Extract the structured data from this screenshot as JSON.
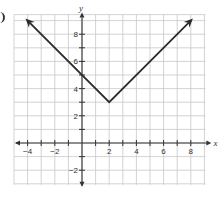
{
  "chart_data": {
    "type": "line",
    "title": "",
    "equation": "y = |x - 2| + 3",
    "xlabel": "x",
    "ylabel": "y",
    "xlim": [
      -5,
      9
    ],
    "ylim": [
      -3,
      9
    ],
    "grid": true,
    "x_ticks": [
      -4,
      -2,
      2,
      4,
      6,
      8
    ],
    "y_ticks": [
      -2,
      2,
      4,
      6,
      8
    ],
    "x_tick_labels": [
      "−4",
      "−2",
      "2",
      "4",
      "6",
      "8"
    ],
    "y_tick_labels": [
      "−2",
      "2",
      "4",
      "6",
      "8"
    ],
    "series": [
      {
        "name": "absolute value function",
        "points": [
          [
            -4,
            9
          ],
          [
            2,
            3
          ],
          [
            8,
            9
          ]
        ],
        "arrows": "both ends",
        "vertex": [
          2,
          3
        ],
        "y_intercept": 5
      }
    ],
    "colors": {
      "line": "#2b2b2b",
      "grid": "#c8c8c8",
      "axis": "#333333"
    }
  }
}
